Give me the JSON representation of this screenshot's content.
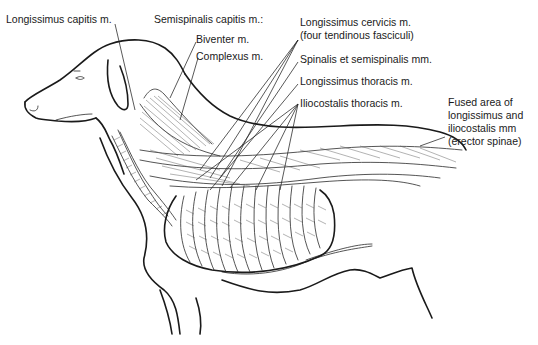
{
  "figure": {
    "labels": {
      "longissimus_capitis": "Longissimus capitis m.",
      "semispinalis_capitis": "Semispinalis capitis m.:",
      "biventer": "Biventer m.",
      "complexus": "Complexus m.",
      "longissimus_cervicis_1": "Longissimus cervicis m.",
      "longissimus_cervicis_2": "(four tendinous fasciculi)",
      "spinalis_semispinalis": "Spinalis et semispinalis mm.",
      "longissimus_thoracis": "Longissimus thoracis m.",
      "iliocostalis_thoracis": "Iliocostalis thoracis m.",
      "fused_1": "Fused area of",
      "fused_2": "longissimus and",
      "fused_3": "iliocostalis mm",
      "fused_4": "(erector spinae)"
    }
  }
}
